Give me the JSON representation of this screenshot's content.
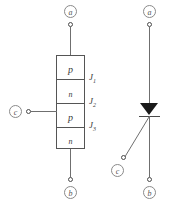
{
  "figure": {
    "stroke_color": "#6f6f6f",
    "outline_color": "#555555",
    "fill_color": "#1a1a1a",
    "label_color": "#555555"
  },
  "structure": {
    "terminal_top": "a",
    "terminal_bottom": "b",
    "terminal_gate": "c",
    "layers": [
      {
        "label": "p",
        "type": "p"
      },
      {
        "label": "n",
        "type": "n"
      },
      {
        "label": "p",
        "type": "p"
      },
      {
        "label": "n",
        "type": "n"
      }
    ],
    "junctions": [
      {
        "name": "J",
        "index": "1"
      },
      {
        "name": "J",
        "index": "2"
      },
      {
        "name": "J",
        "index": "3"
      }
    ]
  },
  "symbol": {
    "terminal_top": "a",
    "terminal_bottom": "b",
    "terminal_gate": "c",
    "device": "thyristor-scr"
  }
}
